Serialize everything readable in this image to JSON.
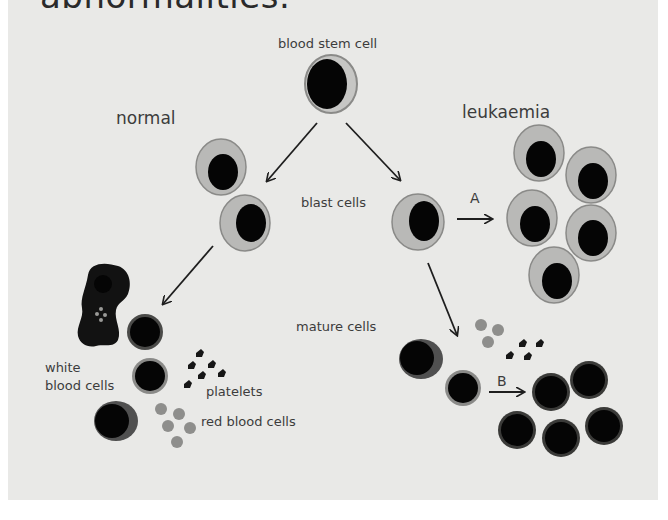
{
  "header": {
    "title_cut": "abnormalities."
  },
  "labels": {
    "stem_cell": "blood stem cell",
    "normal": "normal",
    "leukaemia": "leukaemia",
    "blast_cells": "blast cells",
    "mature_cells": "mature cells",
    "white_blood_cells_line1": "white",
    "white_blood_cells_line2": "blood cells",
    "platelets": "platelets",
    "red_blood_cells": "red blood cells",
    "arrow_a": "A",
    "arrow_b": "B"
  },
  "colors": {
    "background": "#e9e9e7",
    "cytoplasm": "#b9b9b7",
    "cell_outline": "#8a8a88",
    "nucleus": "#050505",
    "mature_rim": "#5a5a58",
    "red_cell": "#8e8e8c",
    "platelet": "#161616",
    "text": "#3c3c3c",
    "arrow": "#1e1e1e"
  }
}
